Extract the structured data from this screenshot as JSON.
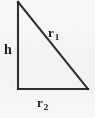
{
  "figure": {
    "name": "right-triangle-diagram",
    "background_color": "#fbfaf9",
    "line_color": "#1f1f21",
    "labels": {
      "vertical_leg": "h",
      "hypotenuse_base": "r",
      "hypotenuse_subscript": "1",
      "horizontal_leg_base": "r",
      "horizontal_leg_subscript": "2"
    },
    "geometry": {
      "apex": "18,2",
      "right_angle_vertex": "18,89",
      "base_end_vertex": "88,89",
      "vertical_leg_points": "18,2 18,89",
      "horizontal_leg_points": "18,89 88,89",
      "hypotenuse_points": "18,2 88,89"
    }
  }
}
